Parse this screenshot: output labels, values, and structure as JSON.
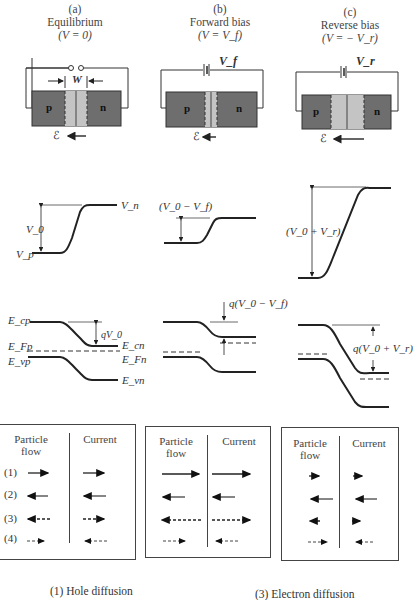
{
  "columns": [
    {
      "letter": "(a)",
      "title": "Equilibrium",
      "condition": "(V = 0)"
    },
    {
      "letter": "(b)",
      "title": "Forward bias",
      "condition": "(V = V_f)"
    },
    {
      "letter": "(c)",
      "title": "Reverse bias",
      "condition": "(V = − V_r)"
    }
  ],
  "junction": {
    "p_label": "p",
    "n_label": "n",
    "width_label": "W",
    "field_label": "ℰ",
    "battery_forward": "V_f",
    "battery_reverse": "V_r",
    "colors": {
      "neutral_region": "#6e6e6e",
      "depletion_region": "#c4c4c4",
      "wire": "#333333"
    }
  },
  "potential": {
    "a": {
      "top_label": "V_n",
      "bottom_label": "V_p",
      "barrier_label": "V_0"
    },
    "b": {
      "barrier_label": "(V_0 − V_f)"
    },
    "c": {
      "barrier_label": "(V_0 + V_r)"
    }
  },
  "bands": {
    "a": {
      "Ecp": "E_cp",
      "Ecn": "E_cn",
      "EFp": "E_Fp",
      "EFn": "E_Fn",
      "Evp": "E_vp",
      "Evn": "E_vn",
      "barrier": "qV_0"
    },
    "b": {
      "barrier": "q(V_0 − V_f)"
    },
    "c": {
      "barrier": "q(V_0 + V_r)"
    }
  },
  "flow_tables": {
    "header_particle": "Particle flow",
    "header_current": "Current",
    "row_labels": [
      "(1)",
      "(2)",
      "(3)",
      "(4)"
    ],
    "a": {
      "particle": [
        {
          "dir": "right",
          "len": "medium",
          "style": "solid"
        },
        {
          "dir": "left",
          "len": "medium",
          "style": "solid"
        },
        {
          "dir": "left",
          "len": "medium",
          "style": "dashed"
        },
        {
          "dir": "right",
          "len": "medium",
          "style": "dashed-dot"
        }
      ],
      "current": [
        {
          "dir": "right",
          "len": "medium",
          "style": "solid"
        },
        {
          "dir": "left",
          "len": "medium",
          "style": "solid"
        },
        {
          "dir": "right",
          "len": "medium",
          "style": "dashed"
        },
        {
          "dir": "left",
          "len": "medium",
          "style": "dashed-dot"
        }
      ]
    },
    "b": {
      "particle": [
        {
          "dir": "right",
          "len": "long",
          "style": "solid"
        },
        {
          "dir": "left",
          "len": "medium",
          "style": "solid"
        },
        {
          "dir": "left",
          "len": "long",
          "style": "dashed"
        },
        {
          "dir": "right",
          "len": "medium",
          "style": "dashed-dot"
        }
      ],
      "current": [
        {
          "dir": "right",
          "len": "long",
          "style": "solid"
        },
        {
          "dir": "left",
          "len": "medium",
          "style": "solid"
        },
        {
          "dir": "right",
          "len": "long",
          "style": "dashed"
        },
        {
          "dir": "left",
          "len": "medium",
          "style": "dashed-dot"
        }
      ]
    },
    "c": {
      "particle": [
        {
          "dir": "right",
          "len": "short",
          "style": "solid"
        },
        {
          "dir": "left",
          "len": "medium",
          "style": "solid"
        },
        {
          "dir": "left",
          "len": "short",
          "style": "dashed"
        },
        {
          "dir": "right",
          "len": "medium",
          "style": "dashed-dot"
        }
      ],
      "current": [
        {
          "dir": "right",
          "len": "short",
          "style": "solid"
        },
        {
          "dir": "left",
          "len": "medium",
          "style": "solid"
        },
        {
          "dir": "right",
          "len": "short",
          "style": "dashed"
        },
        {
          "dir": "left",
          "len": "medium",
          "style": "dashed-dot"
        }
      ]
    }
  },
  "legend": {
    "item1": "(1)  Hole diffusion",
    "item3": "(3)  Electron diffusion"
  }
}
